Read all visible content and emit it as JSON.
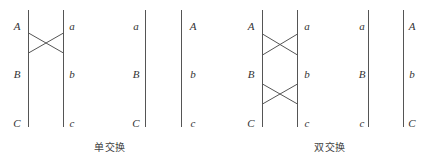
{
  "figure": {
    "line_color": "#555555",
    "panels": [
      {
        "name": "single-before",
        "left_x": 28,
        "right_x": 63,
        "left_labels": [
          "A",
          "B",
          "C"
        ],
        "right_labels": [
          "a",
          "b",
          "c"
        ],
        "crosses": [
          [
            33,
            53
          ]
        ]
      },
      {
        "name": "single-after",
        "left_x": 145,
        "right_x": 181,
        "left_labels": [
          "a",
          "B",
          "C"
        ],
        "right_labels": [
          "A",
          "b",
          "c"
        ],
        "crosses": []
      },
      {
        "name": "double-before",
        "left_x": 262,
        "right_x": 297,
        "left_labels": [
          "A",
          "B",
          "C"
        ],
        "right_labels": [
          "a",
          "b",
          "c"
        ],
        "crosses": [
          [
            34,
            55
          ],
          [
            84,
            104
          ]
        ]
      },
      {
        "name": "double-after",
        "left_x": 368,
        "right_x": 403,
        "left_labels": [
          "a",
          "B",
          "c"
        ],
        "right_labels": [
          "A",
          "b",
          "C"
        ],
        "crosses": []
      }
    ],
    "captions": {
      "single": "单交换",
      "double": "双交换"
    }
  }
}
